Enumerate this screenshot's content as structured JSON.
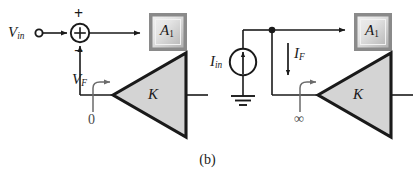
{
  "figure": {
    "caption": "(b)",
    "colors": {
      "line": "#1a1a1a",
      "triangle_fill": "#d4d4d4",
      "block_border": "#6e6e6e",
      "block_fill_light": "#e8e8e8",
      "block_fill_dark": "#b9b9b9",
      "background": "#ffffff"
    }
  },
  "left_circuit": {
    "input_label": "V",
    "input_sub": "in",
    "plus_sign": "+",
    "minus_sign": "−",
    "summing_symbol": "⊕",
    "block_label": "A",
    "block_sub": "1",
    "amplifier_label": "K",
    "feedback_label": "V",
    "feedback_sub": "F",
    "impedance_label": "0"
  },
  "right_circuit": {
    "source_label": "I",
    "source_sub": "in",
    "feedback_current_label": "I",
    "feedback_current_sub": "F",
    "block_label": "A",
    "block_sub": "1",
    "amplifier_label": "K",
    "impedance_label": "∞",
    "ground_name": "ground-symbol"
  }
}
